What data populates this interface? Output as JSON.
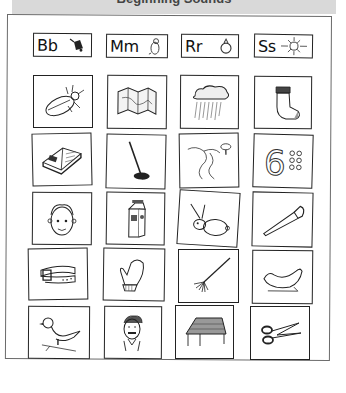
{
  "header": {
    "title": "Beginning Sounds"
  },
  "letter_cards": [
    {
      "letters": "Bb",
      "icon": "bell-icon"
    },
    {
      "letters": "Mm",
      "icon": "mouse-icon"
    },
    {
      "letters": "Rr",
      "icon": "ring-icon"
    },
    {
      "letters": "Ss",
      "icon": "sun-icon"
    }
  ],
  "picture_rows": [
    [
      "beetle",
      "map",
      "rain",
      "sock"
    ],
    [
      "book",
      "mop",
      "river",
      "six"
    ],
    [
      "boy",
      "milk",
      "rabbit",
      "saw"
    ],
    [
      "belt",
      "mitten",
      "rake",
      "seal"
    ],
    [
      "bird",
      "man",
      "roof",
      "scissors"
    ]
  ]
}
